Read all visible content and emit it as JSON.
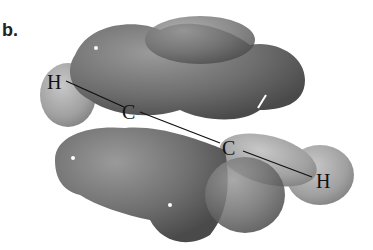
{
  "panel_label": "b.",
  "atoms": [
    {
      "symbol": "H",
      "x": 55,
      "y": 85
    },
    {
      "symbol": "C",
      "x": 130,
      "y": 115
    },
    {
      "symbol": "C",
      "x": 230,
      "y": 150
    },
    {
      "symbol": "H",
      "x": 322,
      "y": 183
    }
  ],
  "colors": {
    "lobe_dark": "#6e6e6e",
    "lobe_light": "#a8a8a8",
    "bond": "#111111"
  }
}
